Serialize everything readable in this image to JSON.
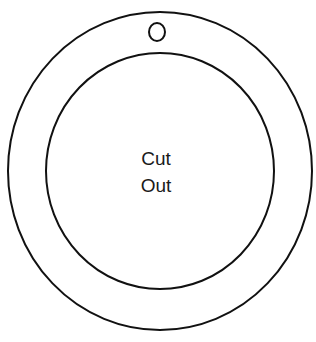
{
  "diagram": {
    "outer_ring": {
      "cx": 160,
      "cy": 171,
      "rx": 152,
      "ry": 159
    },
    "inner_circle": {
      "cx": 160,
      "cy": 171,
      "rx": 114,
      "ry": 118
    },
    "hanging_hole": {
      "cx": 157,
      "cy": 32,
      "rx": 8,
      "ry": 9
    },
    "stroke_color": "#111111",
    "label_lines": [
      "Cut",
      "Out"
    ]
  }
}
